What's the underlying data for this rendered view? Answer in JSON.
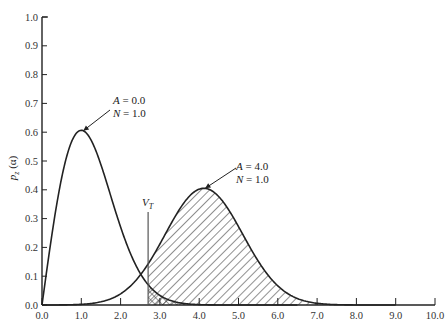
{
  "chart_data": {
    "type": "line",
    "title": "",
    "xlabel": "",
    "ylabel": "p_z (α)",
    "xlim": [
      0.0,
      10.0
    ],
    "ylim": [
      0.0,
      1.0
    ],
    "grid": false,
    "x_ticks": [
      "0.0",
      "1.0",
      "2.0",
      "3.0",
      "4.0",
      "5.0",
      "6.0",
      "7.0",
      "8.0",
      "9.0",
      "10.0"
    ],
    "y_ticks": [
      "0.0",
      "0.1",
      "0.2",
      "0.3",
      "0.4",
      "0.5",
      "0.6",
      "0.7",
      "0.8",
      "0.9",
      "1.0"
    ],
    "series": [
      {
        "name": "A = 0.0, N = 1.0",
        "label_lines": [
          "A = 0.0",
          "N = 1.0"
        ],
        "kind": "rayleigh",
        "A": 0.0,
        "N": 1.0,
        "peak": [
          1.0,
          0.61
        ],
        "x": [
          0.0,
          0.25,
          0.5,
          0.75,
          1.0,
          1.25,
          1.5,
          1.75,
          2.0,
          2.25,
          2.5,
          2.75,
          3.0,
          3.5,
          4.0,
          4.5
        ],
        "values": [
          0.0,
          0.24,
          0.44,
          0.57,
          0.61,
          0.57,
          0.49,
          0.38,
          0.27,
          0.18,
          0.11,
          0.06,
          0.03,
          0.008,
          0.001,
          0.0
        ]
      },
      {
        "name": "A = 4.0, N = 1.0",
        "label_lines": [
          "A = 4.0",
          "N = 1.0"
        ],
        "kind": "rician",
        "A": 4.0,
        "N": 1.0,
        "peak": [
          4.1,
          0.4
        ],
        "x": [
          0.0,
          1.0,
          1.5,
          2.0,
          2.5,
          3.0,
          3.5,
          4.0,
          4.5,
          5.0,
          5.5,
          6.0,
          6.5,
          7.0,
          7.5,
          8.0,
          9.0
        ],
        "values": [
          0.0,
          0.01,
          0.03,
          0.07,
          0.14,
          0.25,
          0.36,
          0.4,
          0.37,
          0.26,
          0.15,
          0.07,
          0.025,
          0.008,
          0.002,
          0.0,
          0.0
        ]
      }
    ],
    "threshold": {
      "label": "V",
      "subscript": "T",
      "x": 2.7
    },
    "shaded_regions": [
      {
        "description": "area under A=4.0 curve right of V_T",
        "pattern": "diagonal-hatch",
        "x_from": 2.7
      },
      {
        "description": "area under A=0.0 curve right of V_T",
        "pattern": "cross-hatch",
        "x_from": 2.7
      }
    ],
    "annotations": [
      {
        "text": [
          "A = 0.0",
          "N = 1.0"
        ],
        "arrow_to": [
          1.05,
          0.605
        ]
      },
      {
        "text": [
          "A = 4.0",
          "N = 1.0"
        ],
        "arrow_to": [
          4.15,
          0.405
        ]
      }
    ]
  },
  "axes": {
    "ylabel_main": "p",
    "ylabel_sub": "z",
    "ylabel_arg": "(α)"
  }
}
